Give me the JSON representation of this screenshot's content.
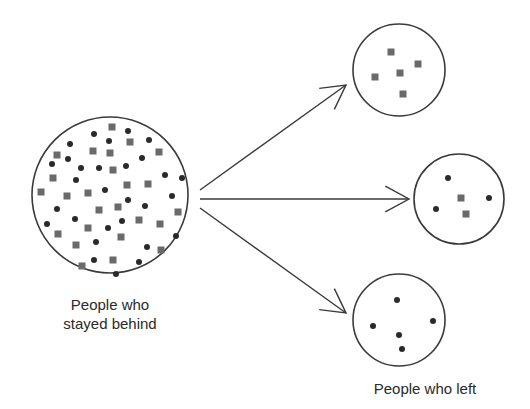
{
  "diagram": {
    "colors": {
      "stroke": "#3a3a3a",
      "square": "#6a6a6a",
      "dot": "#2a2a2a",
      "text": "#2a2a2a",
      "background": "#ffffff"
    },
    "labels": {
      "source_line1": "People who",
      "source_line2": "stayed behind",
      "targets": "People who left"
    },
    "source_group": {
      "name": "People who stayed behind",
      "circle": {
        "cx": 110,
        "cy": 195,
        "r": 78
      },
      "squares": [
        [
          112,
          127
        ],
        [
          130,
          142
        ],
        [
          57,
          155
        ],
        [
          93,
          151
        ],
        [
          110,
          153
        ],
        [
          159,
          152
        ],
        [
          53,
          178
        ],
        [
          113,
          170
        ],
        [
          41,
          192
        ],
        [
          67,
          196
        ],
        [
          88,
          193
        ],
        [
          127,
          185
        ],
        [
          148,
          184
        ],
        [
          99,
          210
        ],
        [
          118,
          207
        ],
        [
          178,
          212
        ],
        [
          139,
          220
        ],
        [
          88,
          228
        ],
        [
          160,
          224
        ],
        [
          58,
          234
        ],
        [
          121,
          237
        ],
        [
          76,
          245
        ],
        [
          161,
          250
        ],
        [
          113,
          260
        ],
        [
          82,
          266
        ]
      ],
      "dots": [
        [
          94,
          134
        ],
        [
          128,
          131
        ],
        [
          70,
          144
        ],
        [
          109,
          141
        ],
        [
          149,
          140
        ],
        [
          68,
          159
        ],
        [
          52,
          164
        ],
        [
          81,
          168
        ],
        [
          99,
          168
        ],
        [
          126,
          166
        ],
        [
          142,
          158
        ],
        [
          165,
          175
        ],
        [
          182,
          178
        ],
        [
          76,
          180
        ],
        [
          105,
          190
        ],
        [
          172,
          196
        ],
        [
          128,
          200
        ],
        [
          145,
          206
        ],
        [
          57,
          209
        ],
        [
          75,
          219
        ],
        [
          122,
          221
        ],
        [
          47,
          224
        ],
        [
          108,
          228
        ],
        [
          176,
          236
        ],
        [
          96,
          242
        ],
        [
          147,
          247
        ],
        [
          94,
          260
        ],
        [
          139,
          262
        ],
        [
          116,
          274
        ]
      ]
    },
    "target_groups": [
      {
        "name": "top group",
        "circle": {
          "cx": 399,
          "cy": 70,
          "r": 46
        },
        "squares": [
          [
            391,
            52
          ],
          [
            418,
            64
          ],
          [
            400,
            73
          ],
          [
            375,
            77
          ],
          [
            403,
            94
          ]
        ],
        "dots": []
      },
      {
        "name": "middle group",
        "circle": {
          "cx": 459,
          "cy": 199,
          "r": 45
        },
        "squares": [
          [
            461,
            198
          ],
          [
            466,
            214
          ]
        ],
        "dots": [
          [
            448,
            178
          ],
          [
            489,
            198
          ],
          [
            436,
            209
          ]
        ]
      },
      {
        "name": "bottom group",
        "circle": {
          "cx": 399,
          "cy": 320,
          "r": 46
        },
        "squares": [],
        "dots": [
          [
            397,
            300
          ],
          [
            373,
            326
          ],
          [
            433,
            321
          ],
          [
            399,
            335
          ],
          [
            402,
            349
          ]
        ]
      }
    ],
    "arrows": [
      {
        "name": "arrow-to-top",
        "from": [
          200,
          190
        ],
        "to": [
          346,
          85
        ]
      },
      {
        "name": "arrow-to-middle",
        "from": [
          200,
          199
        ],
        "to": [
          409,
          199
        ]
      },
      {
        "name": "arrow-to-bottom",
        "from": [
          200,
          208
        ],
        "to": [
          346,
          313
        ]
      }
    ]
  }
}
